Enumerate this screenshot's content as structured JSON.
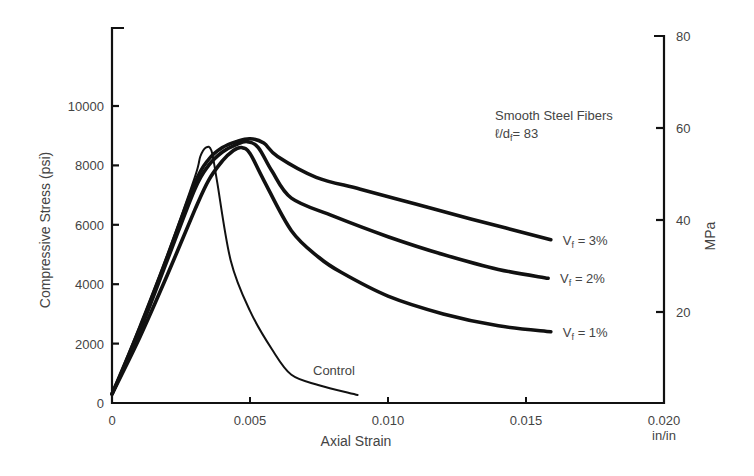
{
  "chart_data": {
    "type": "line",
    "title": "",
    "xlabel": "Axial Strain",
    "xunit": "in/in",
    "ylabel": "Compressive Stress (psi)",
    "y2label": "MPa",
    "xlim": [
      0,
      0.02
    ],
    "ylim": [
      0,
      11600
    ],
    "y2lim": [
      0,
      80
    ],
    "grid": false,
    "legend_position": "inline labels at curve ends",
    "x_ticks": [
      "0",
      "0.005",
      "0.010",
      "0.015",
      "0.020"
    ],
    "x_tick_values": [
      0,
      0.005,
      0.01,
      0.015,
      0.02
    ],
    "y_ticks": [
      "0",
      "2000",
      "4000",
      "6000",
      "8000",
      "10000"
    ],
    "y_tick_values": [
      0,
      2000,
      4000,
      6000,
      8000,
      10000
    ],
    "y2_ticks": [
      "20",
      "40",
      "60",
      "80"
    ],
    "y2_tick_values": [
      20,
      40,
      60,
      80
    ],
    "annotations": {
      "fiber_type": "Smooth Steel Fibers",
      "aspect_ratio_label": "ℓ/d",
      "aspect_ratio_sub": "f",
      "aspect_ratio_value": "= 83"
    },
    "series": [
      {
        "name": "Control",
        "label": "Control",
        "x": [
          0,
          0.001,
          0.002,
          0.003,
          0.0032,
          0.0034,
          0.0036,
          0.0038,
          0.0043,
          0.005,
          0.0058,
          0.0065,
          0.0075,
          0.0089
        ],
        "y": [
          300,
          2600,
          5000,
          7600,
          8300,
          8600,
          8500,
          7500,
          4800,
          3100,
          1800,
          950,
          600,
          270
        ]
      },
      {
        "name": "Vf = 3%",
        "label_main": "V",
        "label_sub": "f",
        "label_val": " = 3%",
        "x": [
          0,
          0.001,
          0.002,
          0.003,
          0.0035,
          0.004,
          0.0045,
          0.005,
          0.0055,
          0.006,
          0.0074,
          0.009,
          0.011,
          0.013,
          0.0159
        ],
        "y": [
          300,
          2500,
          4900,
          7400,
          8200,
          8600,
          8800,
          8900,
          8750,
          8300,
          7600,
          7200,
          6700,
          6200,
          5500
        ]
      },
      {
        "name": "Vf = 2%",
        "label_main": "V",
        "label_sub": "f",
        "label_val": " = 2%",
        "x": [
          0,
          0.001,
          0.002,
          0.003,
          0.0035,
          0.004,
          0.0045,
          0.0049,
          0.0053,
          0.0058,
          0.0065,
          0.008,
          0.01,
          0.012,
          0.014,
          0.0158
        ],
        "y": [
          300,
          2400,
          4800,
          7200,
          8000,
          8450,
          8700,
          8800,
          8600,
          7800,
          6900,
          6300,
          5600,
          5000,
          4500,
          4200
        ]
      },
      {
        "name": "Vf = 1%",
        "label_main": "V",
        "label_sub": "f",
        "label_val": " = 1%",
        "x": [
          0,
          0.001,
          0.002,
          0.003,
          0.0035,
          0.004,
          0.0044,
          0.0047,
          0.005,
          0.0055,
          0.0065,
          0.0075,
          0.0083,
          0.01,
          0.012,
          0.014,
          0.0159
        ],
        "y": [
          300,
          2200,
          4300,
          6500,
          7500,
          8150,
          8500,
          8600,
          8400,
          7500,
          5800,
          4900,
          4400,
          3600,
          3000,
          2600,
          2400
        ]
      }
    ]
  }
}
